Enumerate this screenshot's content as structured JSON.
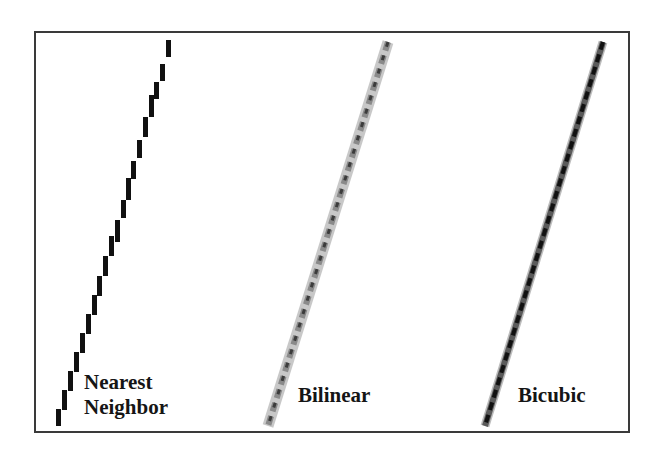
{
  "figure": {
    "panels": [
      {
        "id": "nearest",
        "label_line1": "Nearest",
        "label_line2": "Neighbor",
        "style": "hard-edged staircase (black pixels)"
      },
      {
        "id": "bilinear",
        "label": "Bilinear",
        "style": "blurred gray pixels"
      },
      {
        "id": "bicubic",
        "label": "Bicubic",
        "style": "sharper gray/black pixels"
      }
    ],
    "colors": {
      "border": "#3a3a3a",
      "line_dark": "#111111",
      "line_mid": "#6a6a6a",
      "line_light": "#b5b5b5",
      "background": "#ffffff"
    }
  }
}
